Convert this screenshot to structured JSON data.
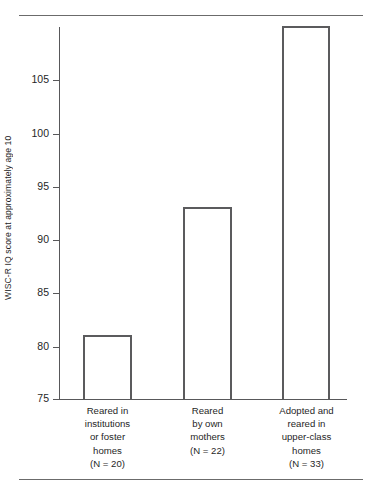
{
  "figure": {
    "rules": [
      "top-rule",
      "bottom-rule"
    ]
  },
  "chart_data": {
    "type": "bar",
    "title": "",
    "subtitle": "",
    "xlabel": "",
    "ylabel": "WISC-R IQ score at approximately age 10",
    "ylim": [
      75,
      110
    ],
    "yticks": [
      75,
      80,
      85,
      90,
      95,
      100,
      105
    ],
    "ytick_labels": [
      "75",
      "80",
      "85",
      "90",
      "95",
      "100",
      "105"
    ],
    "grid": false,
    "legend": null,
    "categories": [
      "Reared in institutions or foster homes",
      "Reared by own mothers",
      "Adopted and reared in upper-class homes"
    ],
    "category_lines": [
      [
        "Reared in",
        "institutions",
        "or foster",
        "homes",
        "(N = 20)"
      ],
      [
        "Reared",
        "by own",
        "mothers",
        "(N = 22)"
      ],
      [
        "Adopted and",
        "reared in",
        "upper-class",
        "homes",
        "(N = 33)"
      ]
    ],
    "group_sizes": [
      20,
      22,
      33
    ],
    "values": [
      81,
      93,
      110
    ],
    "colors": {
      "bar_outline": "#5b5b5d",
      "bar_fill": "transparent",
      "axis": "#58585a",
      "rule": "#6b6b6b",
      "text": "#1f1f1f",
      "background": "#ffffff"
    }
  }
}
